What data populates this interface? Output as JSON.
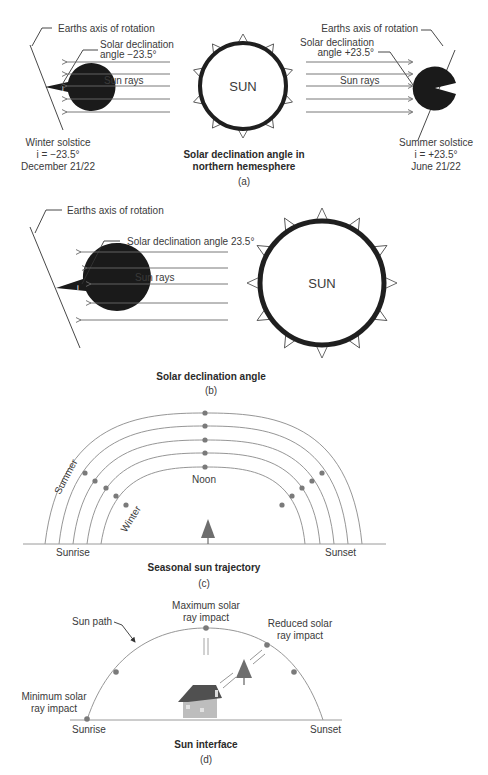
{
  "panel_a": {
    "left_axis_label": "Earths axis of rotation",
    "left_decl_line1": "Solar declination",
    "left_decl_line2": "angle −23.5°",
    "left_rays_label": "Sun rays",
    "left_caption_line1": "Winter solstice",
    "left_caption_line2": "i = −23.5°",
    "left_caption_line3": "December 21/22",
    "sun_label": "SUN",
    "right_axis_label": "Earths axis of rotation",
    "right_decl_line1": "Solar declination",
    "right_decl_line2": "angle +23.5°",
    "right_rays_label": "Sun rays",
    "right_caption_line1": "Summer solstice",
    "right_caption_line2": "i = +23.5°",
    "right_caption_line3": "June 21/22",
    "title_line1": "Solar declination angle in",
    "title_line2": "northern hemesphere",
    "sublabel": "(a)",
    "earth_angle_symbol": "i"
  },
  "panel_b": {
    "axis_label": "Earths axis of rotation",
    "decl_label": "Solar declination angle 23.5°",
    "rays_label": "Sun rays",
    "sun_label": "SUN",
    "title": "Solar declination angle",
    "sublabel": "(b)",
    "earth_angle_symbol": "i"
  },
  "panel_c": {
    "summer_label": "Summer",
    "winter_label": "Winter",
    "noon_label": "Noon",
    "sunrise_label": "Sunrise",
    "sunset_label": "Sunset",
    "title": "Seasonal sun trajectory",
    "sublabel": "(c)",
    "arc_count": 5
  },
  "panel_d": {
    "sun_path_label": "Sun path",
    "max_line1": "Maximum solar",
    "max_line2": "ray impact",
    "reduced_line1": "Reduced solar",
    "reduced_line2": "ray impact",
    "min_line1": "Minimum solar",
    "min_line2": "ray impact",
    "sunrise_label": "Sunrise",
    "sunset_label": "Sunset",
    "title": "Sun interface",
    "sublabel": "(d)"
  },
  "colors": {
    "earth": "#1a1a1a",
    "sun_ring": "#1f1f1f",
    "dot": "#7a7a7a",
    "tree": "#6e6e6e",
    "house_roof": "#505050",
    "house_wall": "#bdbdbd"
  }
}
